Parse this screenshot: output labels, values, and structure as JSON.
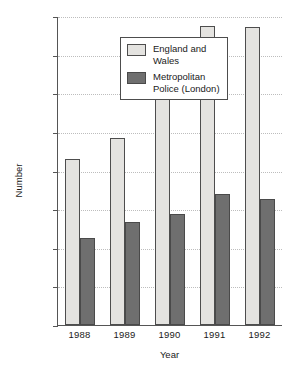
{
  "chart_data": {
    "type": "bar",
    "title": "",
    "subtitle": "",
    "xlabel": "Year",
    "ylabel": "Number",
    "categories": [
      "1988",
      "1989",
      "1990",
      "1991",
      "1992"
    ],
    "series": [
      {
        "name": "England and Wales",
        "legend_label": "England and\nWales",
        "color": "#e4e3e0",
        "values": [
          4300,
          4850,
          6250,
          7750,
          7720
        ]
      },
      {
        "name": "Metropolitan Police (London)",
        "legend_label": "Metropolitan\nPolice (London)",
        "color": "#6f6f6f",
        "values": [
          2250,
          2680,
          2870,
          3400,
          3250
        ]
      }
    ],
    "ylim": [
      0,
      8000
    ],
    "ytick_values": [
      0,
      1000,
      2000,
      3000,
      4000,
      5000,
      6000,
      7000,
      8000
    ],
    "ytick_labels": [
      "0",
      "1,000",
      "2,000",
      "3,000",
      "4,000",
      "5,000",
      "6,000",
      "7,000",
      "8,000"
    ],
    "grid": true,
    "grid_axis": "y",
    "legend_position": "top-left-inside",
    "axis_color": "#555555",
    "grid_color": "#bdbdbd"
  }
}
